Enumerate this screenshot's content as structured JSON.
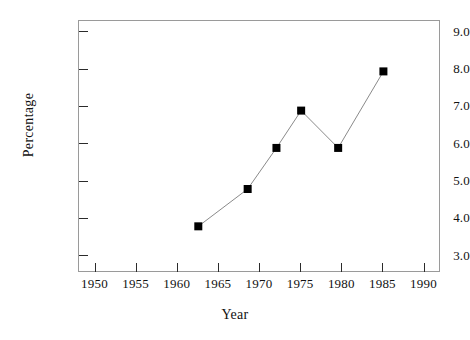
{
  "chart_data": {
    "type": "line",
    "title": "",
    "subtitle": "",
    "xlabel": "Year",
    "ylabel": "Percentage",
    "xlim": [
      1948,
      1992
    ],
    "ylim": [
      2.55,
      9.3
    ],
    "grid": false,
    "legend": null,
    "xticks": [
      1950,
      1955,
      1960,
      1965,
      1970,
      1975,
      1980,
      1985,
      1990
    ],
    "xtick_labels": [
      "1950",
      "1955",
      "1960",
      "1965",
      "1970",
      "1975",
      "1980",
      "1985",
      "1990"
    ],
    "yticks": [
      3.0,
      4.0,
      5.0,
      6.0,
      7.0,
      8.0,
      9.0
    ],
    "ytick_labels": [
      "3.0",
      "4.0",
      "5.0",
      "6.0",
      "7.0",
      "8.0",
      "9.0"
    ],
    "x": [
      1962.5,
      1968.5,
      1972.0,
      1975.0,
      1979.5,
      1985.0
    ],
    "values": [
      3.8,
      4.8,
      5.9,
      6.9,
      5.9,
      7.95
    ],
    "series": [
      {
        "name": "Percentage",
        "x": [
          1962.5,
          1968.5,
          1972.0,
          1975.0,
          1979.5,
          1985.0
        ],
        "values": [
          3.8,
          4.8,
          5.9,
          6.9,
          5.9,
          7.95
        ]
      }
    ],
    "marker": "filled-square",
    "marker_color": "#000000",
    "line_color": "#8a8a8a",
    "frame_color": "#9a9a9a",
    "background": "#ffffff"
  }
}
